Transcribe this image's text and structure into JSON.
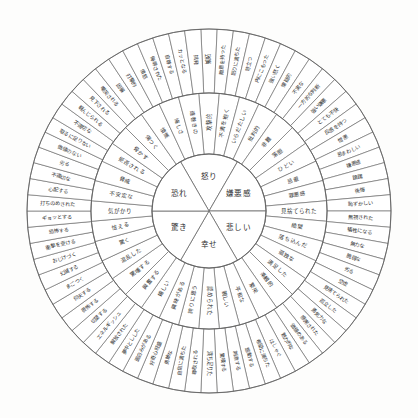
{
  "diagram": {
    "type": "emotion-wheel",
    "rings": 3,
    "colors": {
      "stroke": "#6b6b6b",
      "text": "#2e2e2e",
      "background": "#fdfdfc"
    }
  },
  "core": [
    {
      "label": "怒り"
    },
    {
      "label": "嫌悪感"
    },
    {
      "label": "悲しい"
    },
    {
      "label": "幸せ"
    },
    {
      "label": "驚き"
    },
    {
      "label": "恐れ"
    }
  ],
  "middle": [
    {
      "label": "攻撃的"
    },
    {
      "label": "不満を抱く"
    },
    {
      "label": "いらだたしい"
    },
    {
      "label": "批判的"
    },
    {
      "label": "非難"
    },
    {
      "label": "落胆"
    },
    {
      "label": "ひどい"
    },
    {
      "label": "忌避"
    },
    {
      "label": "罪悪感"
    },
    {
      "label": "見捨てられた"
    },
    {
      "label": "絶望"
    },
    {
      "label": "落ち込んだ"
    },
    {
      "label": "孤独な"
    },
    {
      "label": "満足した"
    },
    {
      "label": "楽観的"
    },
    {
      "label": "繁栄"
    },
    {
      "label": "平和な"
    },
    {
      "label": "親しい"
    },
    {
      "label": "認められた"
    },
    {
      "label": "誇りに思う"
    },
    {
      "label": "興味がある"
    },
    {
      "label": "嬉しい"
    },
    {
      "label": "興奮する"
    },
    {
      "label": "驚嘆する"
    },
    {
      "label": "混乱した"
    },
    {
      "label": "驚く"
    },
    {
      "label": "怯える"
    },
    {
      "label": "気がかり"
    },
    {
      "label": "不安定な"
    },
    {
      "label": "脅威"
    },
    {
      "label": "拒否される"
    },
    {
      "label": "脅かす"
    },
    {
      "label": "傷つく"
    },
    {
      "label": "憤慨"
    },
    {
      "label": "悔しさ"
    },
    {
      "label": "遠巻きの"
    }
  ],
  "outer": [
    {
      "label": "嫉妬"
    },
    {
      "label": "敵意を持った"
    },
    {
      "label": "怒りに満ちた"
    },
    {
      "label": "苛立つ"
    },
    {
      "label": "内にこもった"
    },
    {
      "label": "強い怒く"
    },
    {
      "label": "懐疑的"
    },
    {
      "label": "不実な"
    },
    {
      "label": "一方的な判断"
    },
    {
      "label": "強い嫌悪"
    },
    {
      "label": "とても不快"
    },
    {
      "label": "反感を持つ"
    },
    {
      "label": "憎悪"
    },
    {
      "label": "忌まわしい"
    },
    {
      "label": "嫌悪感"
    },
    {
      "label": "躊躇"
    },
    {
      "label": "後悔"
    },
    {
      "label": "恥ずかしい"
    },
    {
      "label": "無視された"
    },
    {
      "label": "犠牲になる"
    },
    {
      "label": "無力な"
    },
    {
      "label": "脆弱な"
    },
    {
      "label": "劣る"
    },
    {
      "label": "空虚"
    },
    {
      "label": "見捨てられた"
    },
    {
      "label": "孤立した"
    },
    {
      "label": "勇気力な"
    },
    {
      "label": "感謝された"
    },
    {
      "label": "価値のある"
    },
    {
      "label": "魅力的な"
    },
    {
      "label": "はしゃぐ"
    },
    {
      "label": "希望に満ちた"
    },
    {
      "label": "感動する"
    },
    {
      "label": "刺激する"
    },
    {
      "label": "驚嘆する"
    },
    {
      "label": "満ち足りた"
    },
    {
      "label": "尊敬される"
    },
    {
      "label": "自信に満ちた"
    },
    {
      "label": "勇敢な"
    },
    {
      "label": "好奇心旺盛"
    },
    {
      "label": "面白みがある"
    },
    {
      "label": "夢中としした"
    },
    {
      "label": "解放された"
    },
    {
      "label": "エネルギッシュ"
    },
    {
      "label": "切望する"
    },
    {
      "label": "畏怖する"
    },
    {
      "label": "仰天する"
    },
    {
      "label": "まごつく"
    },
    {
      "label": "幻滅する"
    },
    {
      "label": "おじけづく"
    },
    {
      "label": "衝撃を受ける"
    },
    {
      "label": "恐怖する"
    },
    {
      "label": "ギョッとする"
    },
    {
      "label": "打ちのめされた"
    },
    {
      "label": "心配する"
    },
    {
      "label": "不適切な"
    },
    {
      "label": "劣る"
    },
    {
      "label": "価値のない"
    },
    {
      "label": "取るに足りない"
    },
    {
      "label": "不適切な"
    },
    {
      "label": "軽んじられる"
    },
    {
      "label": "見下される"
    },
    {
      "label": "嘲笑される"
    },
    {
      "label": "因襲"
    },
    {
      "label": "打撃的"
    },
    {
      "label": "憤怒"
    },
    {
      "label": "侮辱された"
    },
    {
      "label": "自尊する"
    },
    {
      "label": "カッとなる"
    },
    {
      "label": "挑発"
    }
  ]
}
